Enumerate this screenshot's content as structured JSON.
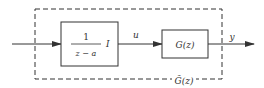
{
  "diagram": {
    "type": "block-diagram",
    "colors": {
      "stroke": "#333333",
      "background": "#ffffff"
    },
    "blocks": [
      {
        "id": "integrator",
        "numerator": "1",
        "denominator": "z − a",
        "suffix": "I"
      },
      {
        "id": "plant",
        "label": "G(z)"
      }
    ],
    "signals": {
      "between": "u",
      "output": "y"
    },
    "group_label": "G̃(z)"
  }
}
